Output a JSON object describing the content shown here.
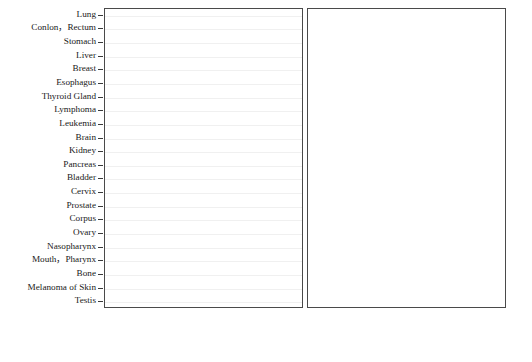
{
  "chart_data": {
    "type": "bar",
    "title": "",
    "subtitle": "",
    "orientation": "horizontal",
    "layout": "back-to-back butterfly, two panels sharing category axis",
    "grid": true,
    "legend_position": "bottom-right",
    "xlabel_left": "Urban (1/10^5)",
    "xlabel_right": "Rural (1/10^5)",
    "ylabel": "",
    "xlim": [
      0,
      70
    ],
    "xticks": [
      0,
      10,
      20,
      30,
      40,
      50,
      60,
      70
    ],
    "xtick_labels_left": [
      "70",
      "60",
      "50",
      "40",
      "30",
      "20",
      "10",
      "0"
    ],
    "xtick_labels_right": [
      "0",
      "10",
      "20",
      "30",
      "40",
      "50",
      "60",
      "70"
    ],
    "categories": [
      "Lung",
      "Conlon，Rectum",
      "Stomach",
      "Liver",
      "Breast",
      "Esophagus",
      "Thyroid Gland",
      "Lymphoma",
      "Leukemia",
      "Brain",
      "Kidney",
      "Pancreas",
      "Bladder",
      "Cervix",
      "Prostate",
      "Corpus",
      "Ovary",
      "Nasopharynx",
      "Mouth，Pharynx",
      "Bone",
      "Melanoma of Skin",
      "Testis"
    ],
    "panels": [
      {
        "name": "Urban",
        "axis_label": "Urban (1/10^5)",
        "direction": "left",
        "series": [
          {
            "name": "Male",
            "values": [
              49.5,
              22.0,
              22.5,
              22.8,
              0.3,
              4.1,
              1.4,
              3.2,
              3.1,
              2.6,
              3.1,
              3.2,
              4.5,
              0.0,
              6.6,
              0.0,
              0.0,
              2.4,
              2.0,
              1.0,
              0.4,
              0.2
            ]
          },
          {
            "name": "Female",
            "values": [
              23.3,
              17.2,
              10.2,
              8.0,
              31.0,
              1.6,
              4.5,
              2.2,
              2.6,
              2.3,
              1.6,
              2.6,
              1.2,
              8.3,
              0.0,
              4.8,
              4.6,
              1.0,
              1.0,
              0.8,
              0.4,
              0.0
            ]
          }
        ]
      },
      {
        "name": "Rural",
        "axis_label": "Rural (1/10^5)",
        "direction": "right",
        "series": [
          {
            "name": "Male",
            "values": [
              42.0,
              20.5,
              49.8,
              35.0,
              0.2,
              36.0,
              0.6,
              2.6,
              2.8,
              2.4,
              1.4,
              2.4,
              1.6,
              0.0,
              1.9,
              0.0,
              0.0,
              2.0,
              1.8,
              1.1,
              0.3,
              0.2
            ]
          },
          {
            "name": "Female",
            "values": [
              21.0,
              11.8,
              22.8,
              11.6,
              15.5,
              16.0,
              2.0,
              1.8,
              2.2,
              2.1,
              0.8,
              1.9,
              0.5,
              8.8,
              0.0,
              1.6,
              2.0,
              0.9,
              0.9,
              0.9,
              0.3,
              0.0
            ]
          }
        ]
      }
    ],
    "legend": [
      {
        "label": "Male",
        "color": "#9a9a9a"
      },
      {
        "label": "Female",
        "color": "#9a9a9a"
      }
    ]
  },
  "colors": {
    "bar_fill": "#9a9a9a",
    "bar_stroke": "#4c4c4c",
    "axis": "#4a4a4a",
    "grid": "#f0f0f0",
    "text": "#1a1a1a"
  }
}
